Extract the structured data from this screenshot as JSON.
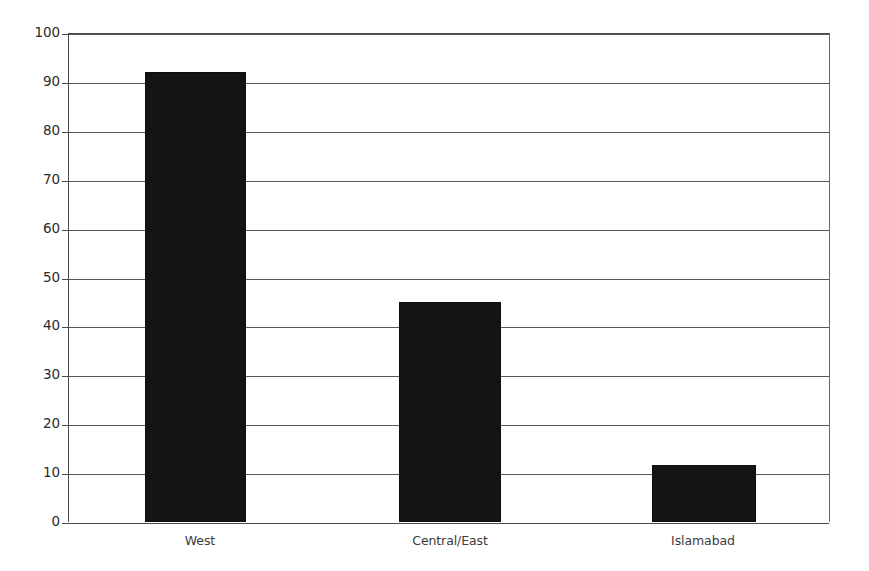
{
  "chart_data": {
    "type": "bar",
    "title": "",
    "subtitle": "",
    "xlabel": "",
    "ylabel": "",
    "categories": [
      "West",
      "Central/East",
      "Islamabad"
    ],
    "values": [
      92,
      45,
      11.7
    ],
    "series": [
      {
        "name": "",
        "values": [
          92,
          45,
          11.7
        ]
      }
    ],
    "ylim": [
      0,
      100
    ],
    "ytick_labels": [
      "100",
      "90",
      "80",
      "70",
      "60",
      "50",
      "40",
      "30",
      "20",
      "10",
      "0"
    ],
    "ytick_values": [
      100,
      90,
      80,
      70,
      60,
      50,
      40,
      30,
      20,
      10,
      0
    ],
    "grid": true,
    "grid_axis": "y",
    "legend": false,
    "legend_position": "none",
    "bar_color": "#141414",
    "grid_color": "#58585a",
    "axis_color": "#4a4a4a",
    "background_color": "#ffffff",
    "text_color": "#2b2b2b"
  },
  "axes": {
    "y_axis_name": "y-axis",
    "x_axis_name": "x-axis"
  }
}
